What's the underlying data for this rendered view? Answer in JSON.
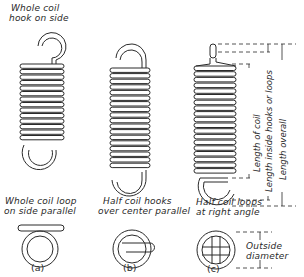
{
  "figure": {
    "springs": [
      {
        "id": "a",
        "top_label": [
          "Whole coil",
          "hook on side"
        ],
        "end_label": [
          "Whole coil loop",
          "on side parallel"
        ],
        "caption": "(a)"
      },
      {
        "id": "b",
        "end_label": [
          "Half coil hooks",
          "over center parallel"
        ],
        "caption": "(b)"
      },
      {
        "id": "c",
        "end_label": [
          "Half coil loops",
          "at right angle"
        ],
        "caption": "(c)",
        "dimensions": {
          "length_of_coil": "Length of coil",
          "length_inside": "Length inside hooks or loops",
          "length_overall": "Length overall",
          "outside_diameter": [
            "Outside",
            "diameter"
          ]
        }
      }
    ]
  }
}
